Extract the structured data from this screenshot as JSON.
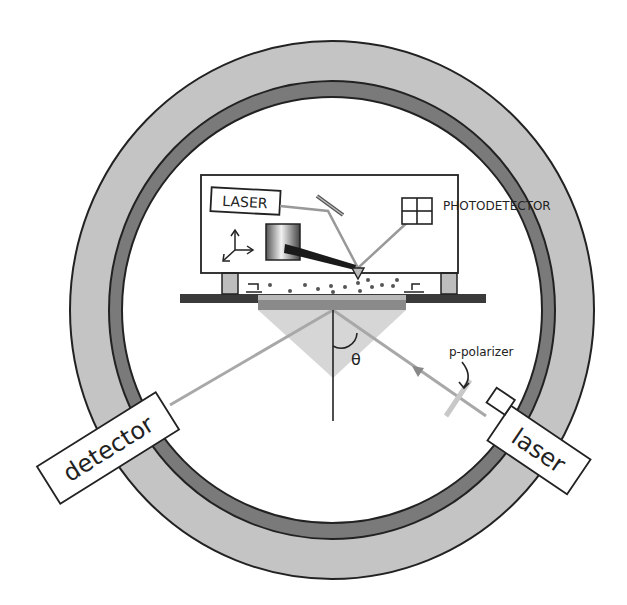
{
  "labels": {
    "laser_internal": "LASER",
    "photodetector": "PHOTODETECTOR",
    "polarizer": "p-polarizer",
    "theta": "θ",
    "detector": "detector",
    "laser_external": "laser"
  },
  "colors": {
    "ring_outer": "#c4c4c4",
    "ring_inner": "#7a7a7a",
    "outline": "#222222",
    "beam": "#a8a8a8",
    "prism": "#d6d6d6",
    "platform": "#3a3a3a",
    "sample": "#8a8a8a",
    "leg": "#bdbdbd"
  }
}
